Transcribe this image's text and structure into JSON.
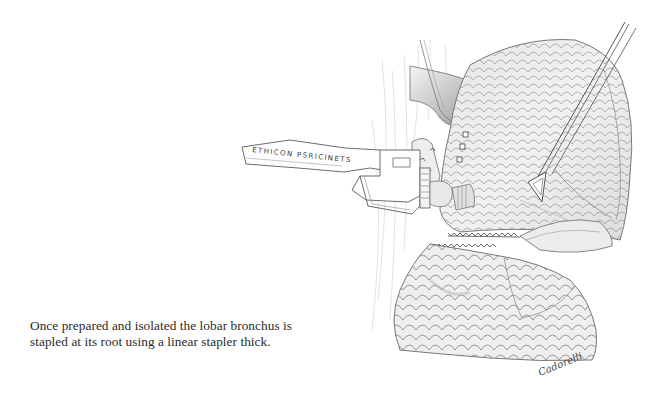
{
  "figure": {
    "caption_lines": [
      "Once prepared and isolated the lobar bronchus is",
      "stapled at its root using a linear stapler thick."
    ],
    "instrument_label": "ETHICON ENDO-SURGERY",
    "instrument_label_visible": "ETHICON PSRICINETS",
    "artist_signature": "Cadorelli",
    "colors": {
      "background": "#ffffff",
      "ink": "#2b2b2b",
      "pencil_shading": "#9a9a9a",
      "light_shading": "#d6d6d6"
    }
  }
}
